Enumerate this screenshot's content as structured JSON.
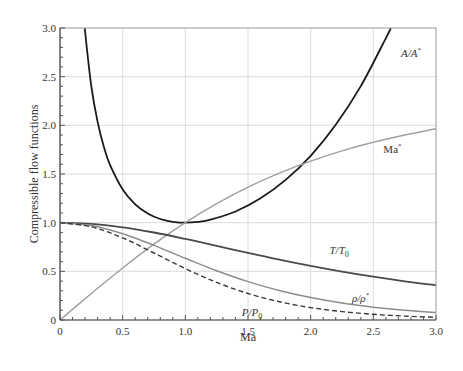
{
  "chart_data": {
    "type": "line",
    "title": "",
    "xlabel": "Ma",
    "ylabel": "Compressible flow functions",
    "xlim": [
      0,
      3.0
    ],
    "ylim": [
      0,
      3.0
    ],
    "grid": true,
    "legend": "inline labels",
    "xticks": [
      "0",
      "0.5",
      "1.0",
      "1.5",
      "2.0",
      "2.5",
      "3.0"
    ],
    "yticks": [
      "0",
      "0.5",
      "1.0",
      "1.5",
      "2.0",
      "2.5",
      "3.0"
    ],
    "series": [
      {
        "name": "A/A*",
        "label_main": "A/A",
        "label_sup": "*",
        "style": "solid",
        "color": "#1a1a1a",
        "width": 1.8,
        "x": [
          0.19,
          0.2,
          0.25,
          0.3,
          0.35,
          0.4,
          0.5,
          0.6,
          0.7,
          0.8,
          0.9,
          1.0,
          1.1,
          1.2,
          1.4,
          1.6,
          1.8,
          2.0,
          2.2,
          2.4,
          2.6,
          2.64
        ],
        "y": [
          3.12,
          2.964,
          2.403,
          2.035,
          1.778,
          1.59,
          1.34,
          1.188,
          1.094,
          1.038,
          1.009,
          1.0,
          1.008,
          1.03,
          1.115,
          1.25,
          1.439,
          1.6875,
          2.005,
          2.403,
          2.896,
          3.0
        ]
      },
      {
        "name": "Ma*",
        "label_main": "Ma",
        "label_sup": "*",
        "style": "solid",
        "color": "#a0a0a0",
        "width": 1.5,
        "x": [
          0,
          0.25,
          0.5,
          0.75,
          1.0,
          1.25,
          1.5,
          1.75,
          2.0,
          2.25,
          2.5,
          2.75,
          3.0
        ],
        "y": [
          0,
          0.2722,
          0.5345,
          0.7789,
          1.0,
          1.1952,
          1.3646,
          1.5097,
          1.633,
          1.7374,
          1.8257,
          1.9005,
          1.964
        ]
      },
      {
        "name": "T/T0",
        "label_main": "T/T",
        "label_sub": "0",
        "style": "solid",
        "color": "#4a4a4a",
        "width": 1.8,
        "x": [
          0,
          0.25,
          0.5,
          0.75,
          1.0,
          1.25,
          1.5,
          1.75,
          2.0,
          2.25,
          2.5,
          2.75,
          3.0
        ],
        "y": [
          1.0,
          0.9877,
          0.9524,
          0.8989,
          0.8333,
          0.7619,
          0.6897,
          0.6202,
          0.5556,
          0.4969,
          0.4444,
          0.398,
          0.3571
        ]
      },
      {
        "name": "ρ/ρ*",
        "label_main": "ρ/ρ",
        "label_sup": "*",
        "style": "solid",
        "color": "#8c8c8c",
        "width": 1.5,
        "x": [
          0,
          0.25,
          0.5,
          0.75,
          1.0,
          1.25,
          1.5,
          1.75,
          2.0,
          2.25,
          2.5,
          2.75,
          3.0
        ],
        "y": [
          1.0,
          0.9694,
          0.8852,
          0.766,
          0.6339,
          0.5067,
          0.395,
          0.3029,
          0.23,
          0.174,
          0.1317,
          0.0999,
          0.0762
        ]
      },
      {
        "name": "P/P0",
        "label_main": "P/P",
        "label_sub": "0",
        "style": "dashed",
        "color": "#3a3a3a",
        "width": 1.4,
        "x": [
          0,
          0.25,
          0.5,
          0.75,
          1.0,
          1.25,
          1.5,
          1.75,
          2.0,
          2.25,
          2.5,
          2.75,
          3.0
        ],
        "y": [
          1.0,
          0.9575,
          0.843,
          0.6886,
          0.5283,
          0.3861,
          0.2724,
          0.1879,
          0.1278,
          0.0865,
          0.0585,
          0.0398,
          0.0272
        ]
      }
    ],
    "annotations": [
      {
        "series": "A/A*",
        "x": 2.72,
        "y": 2.7
      },
      {
        "series": "Ma*",
        "x": 2.58,
        "y": 1.72
      },
      {
        "series": "T/T0",
        "x": 2.15,
        "y": 0.68
      },
      {
        "series": "ρ/ρ*",
        "x": 2.33,
        "y": 0.19
      },
      {
        "series": "P/P0",
        "x": 1.45,
        "y": 0.04
      }
    ]
  },
  "colors": {
    "grid": "#dcdcdc",
    "axis": "#555555",
    "tick_text": "#333333"
  }
}
